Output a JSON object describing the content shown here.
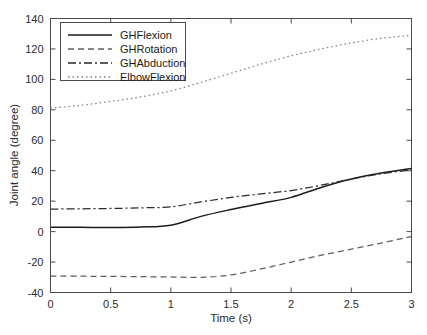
{
  "chart_data": {
    "type": "line",
    "title": "",
    "xlabel": "Time (s)",
    "ylabel": "Joint angle (degree)",
    "xlim": [
      0,
      3
    ],
    "ylim": [
      -40,
      140
    ],
    "xticks": [
      "0",
      "0.5",
      "1",
      "1.5",
      "2",
      "2.5",
      "3"
    ],
    "xtick_values": [
      0,
      0.5,
      1,
      1.5,
      2,
      2.5,
      3
    ],
    "yticks": [
      "-40",
      "-20",
      "0",
      "20",
      "40",
      "60",
      "80",
      "100",
      "120",
      "140"
    ],
    "ytick_values": [
      -40,
      -20,
      0,
      20,
      40,
      60,
      80,
      100,
      120,
      140
    ],
    "grid": false,
    "legend_position": "upper left",
    "x": [
      0,
      0.25,
      0.5,
      0.75,
      1,
      1.25,
      1.5,
      1.75,
      2,
      2.25,
      2.5,
      2.75,
      3
    ],
    "series": [
      {
        "name": "GHFlexion",
        "style": "solid",
        "color": "#1c1c1c",
        "values": [
          2.8,
          2.8,
          2.7,
          3.0,
          4.2,
          10.0,
          14.5,
          18.5,
          22.5,
          29.0,
          34.5,
          38.5,
          41.5
        ]
      },
      {
        "name": "GHRotation",
        "style": "dashed",
        "color": "#5d5d5d",
        "values": [
          -29.2,
          -29.3,
          -29.4,
          -29.6,
          -29.8,
          -30.0,
          -28.5,
          -24.5,
          -20.0,
          -15.5,
          -11.5,
          -7.5,
          -3.2
        ]
      },
      {
        "name": "GHAbduction",
        "style": "dash-dot",
        "color": "#2a2a2a",
        "values": [
          14.8,
          15.0,
          15.2,
          15.6,
          16.3,
          19.5,
          22.5,
          24.8,
          27.0,
          30.5,
          34.5,
          38.0,
          40.5
        ]
      },
      {
        "name": "ElbowFlexion",
        "style": "dotted",
        "color": "#808080",
        "values": [
          81.0,
          83.0,
          85.5,
          88.5,
          92.5,
          98.0,
          104.0,
          110.0,
          115.5,
          120.0,
          124.0,
          127.0,
          129.0
        ]
      }
    ]
  },
  "axes": {
    "ylabel": "Joint angle (degree)",
    "xlabel": "Time (s)"
  },
  "legend": {
    "entries": [
      {
        "label": "GHFlexion"
      },
      {
        "label": "GHRotation"
      },
      {
        "label": "GHAbduction"
      },
      {
        "label": "ElbowFlexion"
      }
    ]
  },
  "caption": {
    "sliver_text": ""
  }
}
